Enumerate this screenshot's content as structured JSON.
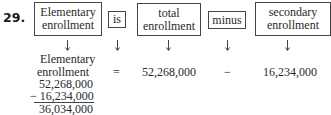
{
  "problem_number": "29.",
  "equation_words": [
    {
      "label": "Elementary enrollment",
      "line1": "Elementary",
      "line2": "enrollment"
    },
    {
      "label": "is"
    },
    {
      "label": "total enrollment",
      "line1": "total",
      "line2": "enrollment"
    },
    {
      "label": "minus"
    },
    {
      "label": "secondary enrollment",
      "line1": "secondary",
      "line2": "enrollment"
    }
  ],
  "arrow_icon": "down-arrow",
  "translation": {
    "unknown_line1": "Elementary",
    "unknown_line2": "enrollment",
    "equals": "=",
    "total": "52,268,000",
    "operator": "−",
    "secondary": "16,234,000"
  },
  "computation": {
    "minuend": "52,268,000",
    "subtrahend": "− 16,234,000",
    "result": "36,034,000"
  }
}
